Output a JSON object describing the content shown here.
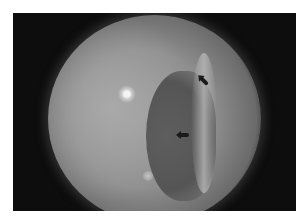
{
  "image": {
    "description": "Grayscale circular fundus-style photograph on a black background, with two black arrows marking a dark crescent-shaped region on the right side",
    "background_color": "#0d0d0d",
    "disc_color": "#8e8e8e",
    "arrows": [
      {
        "label": "arrow-upper",
        "direction": "down-right"
      },
      {
        "label": "arrow-lower",
        "direction": "left"
      }
    ]
  }
}
